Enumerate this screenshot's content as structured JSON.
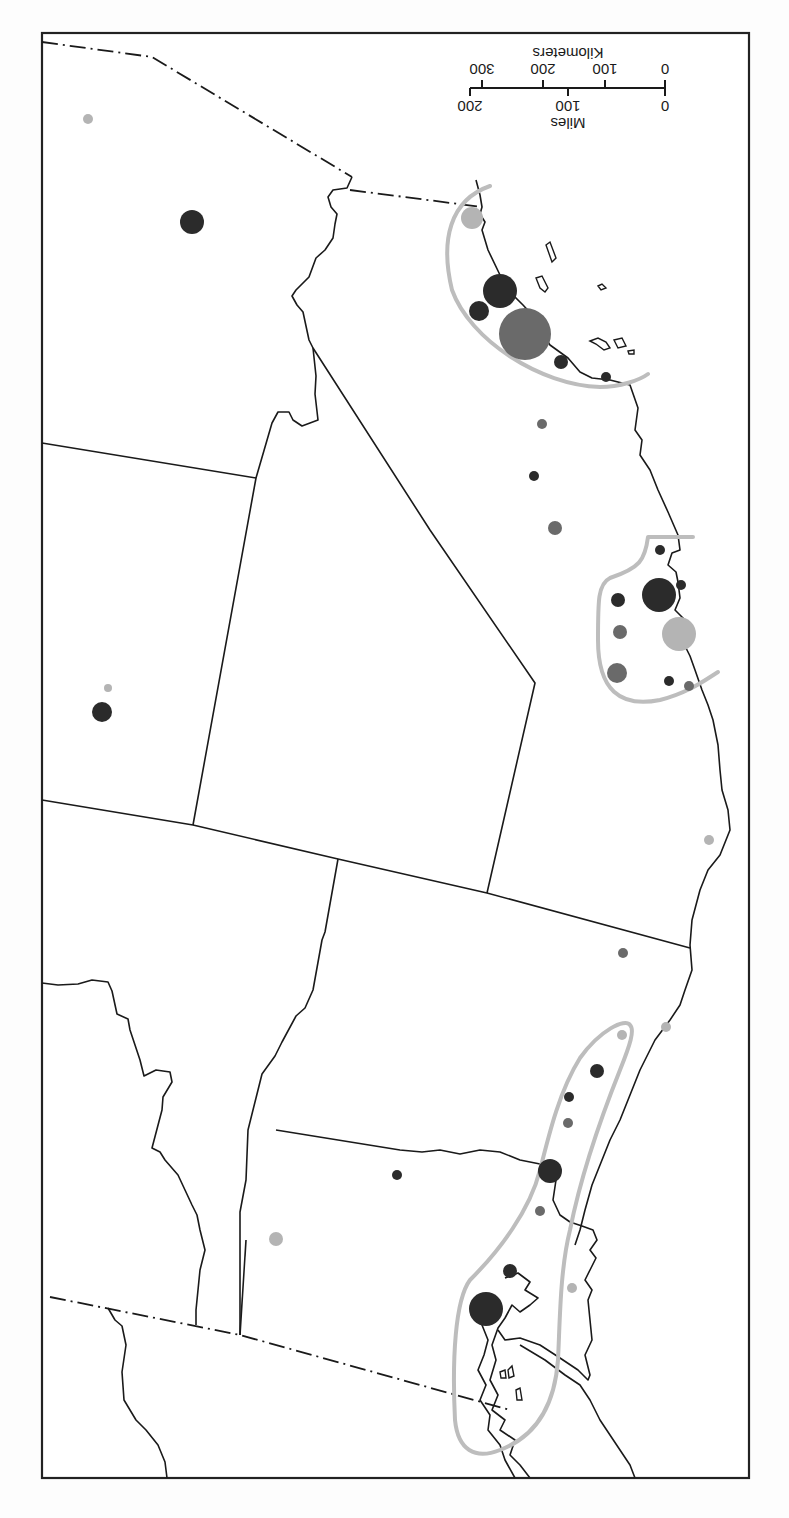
{
  "map": {
    "orientation": "rotated 180 degrees",
    "scale_bar": {
      "miles_label": "Miles",
      "kilometers_label": "Kilometers",
      "miles_ticks": [
        "0",
        "100",
        "200"
      ],
      "kilometers_ticks": [
        "0",
        "100",
        "200",
        "300"
      ]
    },
    "symbol_colors": {
      "dark": "#2b2b2b",
      "medium": "#6a6a6a",
      "light": "#b4b4b4",
      "zone_outline": "#bdbdbd"
    },
    "circles": [
      {
        "x": 88,
        "y": 119,
        "r": 5,
        "shade": "light"
      },
      {
        "x": 192,
        "y": 222,
        "r": 12,
        "shade": "dark"
      },
      {
        "x": 472,
        "y": 218,
        "r": 11,
        "shade": "light"
      },
      {
        "x": 500,
        "y": 291,
        "r": 17,
        "shade": "dark"
      },
      {
        "x": 479,
        "y": 311,
        "r": 10,
        "shade": "dark"
      },
      {
        "x": 525,
        "y": 334,
        "r": 26,
        "shade": "medium"
      },
      {
        "x": 561,
        "y": 362,
        "r": 7,
        "shade": "dark"
      },
      {
        "x": 606,
        "y": 377,
        "r": 5,
        "shade": "dark"
      },
      {
        "x": 542,
        "y": 424,
        "r": 5,
        "shade": "medium"
      },
      {
        "x": 534,
        "y": 476,
        "r": 5,
        "shade": "dark"
      },
      {
        "x": 555,
        "y": 528,
        "r": 7,
        "shade": "medium"
      },
      {
        "x": 660,
        "y": 550,
        "r": 5,
        "shade": "dark"
      },
      {
        "x": 659,
        "y": 595,
        "r": 17,
        "shade": "dark"
      },
      {
        "x": 681,
        "y": 585,
        "r": 5,
        "shade": "dark"
      },
      {
        "x": 618,
        "y": 600,
        "r": 7,
        "shade": "dark"
      },
      {
        "x": 620,
        "y": 632,
        "r": 7,
        "shade": "medium"
      },
      {
        "x": 679,
        "y": 634,
        "r": 17,
        "shade": "light"
      },
      {
        "x": 617,
        "y": 673,
        "r": 10,
        "shade": "medium"
      },
      {
        "x": 669,
        "y": 681,
        "r": 5,
        "shade": "dark"
      },
      {
        "x": 689,
        "y": 686,
        "r": 5,
        "shade": "medium"
      },
      {
        "x": 108,
        "y": 688,
        "r": 4,
        "shade": "light"
      },
      {
        "x": 102,
        "y": 712,
        "r": 10,
        "shade": "dark"
      },
      {
        "x": 709,
        "y": 840,
        "r": 5,
        "shade": "light"
      },
      {
        "x": 623,
        "y": 953,
        "r": 5,
        "shade": "medium"
      },
      {
        "x": 622,
        "y": 1035,
        "r": 5,
        "shade": "light"
      },
      {
        "x": 666,
        "y": 1027,
        "r": 5,
        "shade": "light"
      },
      {
        "x": 597,
        "y": 1071,
        "r": 7,
        "shade": "dark"
      },
      {
        "x": 569,
        "y": 1097,
        "r": 5,
        "shade": "dark"
      },
      {
        "x": 568,
        "y": 1123,
        "r": 5,
        "shade": "medium"
      },
      {
        "x": 550,
        "y": 1171,
        "r": 12,
        "shade": "dark"
      },
      {
        "x": 397,
        "y": 1175,
        "r": 5,
        "shade": "dark"
      },
      {
        "x": 540,
        "y": 1211,
        "r": 5,
        "shade": "medium"
      },
      {
        "x": 276,
        "y": 1239,
        "r": 7,
        "shade": "light"
      },
      {
        "x": 510,
        "y": 1271,
        "r": 7,
        "shade": "dark"
      },
      {
        "x": 572,
        "y": 1288,
        "r": 5,
        "shade": "light"
      },
      {
        "x": 486,
        "y": 1309,
        "r": 17,
        "shade": "dark"
      }
    ]
  }
}
